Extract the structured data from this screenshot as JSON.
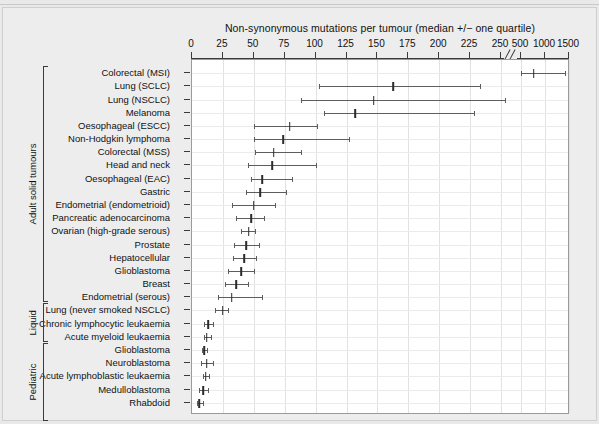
{
  "figure": {
    "background_color": "#ededed",
    "plot_background_color": "#ffffff",
    "axis_color": "#3a3a3a",
    "bar_color": "#5d5d5d",
    "median_color": "#2b2b2b"
  },
  "chart_data": {
    "type": "scatter",
    "title": "Non-synonymous mutations per tumour (median +/− one quartile)",
    "xlabel": "Non-synonymous mutations per tumour (median +/− one quartile)",
    "ylabel": "",
    "orientation": "horizontal",
    "grid": true,
    "legend": null,
    "axis_break": {
      "present": true,
      "between": [
        250,
        500
      ],
      "style": "double-slash"
    },
    "xticks": [
      0,
      25,
      50,
      75,
      100,
      125,
      150,
      175,
      200,
      225,
      250,
      500,
      1000,
      1500
    ],
    "xticklabels": [
      "0",
      "25",
      "50",
      "75",
      "100",
      "125",
      "150",
      "175",
      "200",
      "225",
      "250",
      "500",
      "1000",
      "1500"
    ],
    "xlim": [
      0,
      1500
    ],
    "groups": [
      {
        "name": "Adult solid tumours",
        "start_index": 0,
        "end_index": 17
      },
      {
        "name": "Liquid",
        "start_index": 18,
        "end_index": 20
      },
      {
        "name": "Pediatric",
        "start_index": 21,
        "end_index": 26
      }
    ],
    "categories": [
      "Colorectal (MSI)",
      "Lung (SCLC)",
      "Lung (NSCLC)",
      "Melanoma",
      "Oesophageal (ESCC)",
      "Non-Hodgkin lymphoma",
      "Colorectal (MSS)",
      "Head and neck",
      "Oesophageal (EAC)",
      "Gastric",
      "Endometrial (endometrioid)",
      "Pancreatic adenocarcinoma",
      "Ovarian (high-grade serous)",
      "Prostate",
      "Hepatocellular",
      "Glioblastoma",
      "Breast",
      "Endometrial (serous)",
      "Lung (never smoked NSCLC)",
      "Chronic lymphocytic leukaemia",
      "Acute myeloid leukaemia",
      "Glioblastoma",
      "Neuroblastoma",
      "Acute lymphoblastic leukaemia",
      "Medulloblastoma",
      "Rhabdoid"
    ],
    "points": [
      {
        "label": "Colorectal (MSI)",
        "median": 765,
        "low": 505,
        "high": 1410
      },
      {
        "label": "Lung (SCLC)",
        "median": 163,
        "low": 103,
        "high": 233
      },
      {
        "label": "Lung (NSCLC)",
        "median": 147,
        "low": 88,
        "high": 296
      },
      {
        "label": "Melanoma",
        "median": 132,
        "low": 107,
        "high": 228
      },
      {
        "label": "Oesophageal (ESCC)",
        "median": 79,
        "low": 50,
        "high": 101
      },
      {
        "label": "Non-Hodgkin lymphoma",
        "median": 74,
        "low": 50,
        "high": 127
      },
      {
        "label": "Colorectal (MSS)",
        "median": 66,
        "low": 51,
        "high": 88
      },
      {
        "label": "Head and neck",
        "median": 65,
        "low": 45,
        "high": 100
      },
      {
        "label": "Oesophageal (EAC)",
        "median": 57,
        "low": 48,
        "high": 81
      },
      {
        "label": "Gastric",
        "median": 55,
        "low": 44,
        "high": 76
      },
      {
        "label": "Endometrial (endometrioid)",
        "median": 50,
        "low": 32,
        "high": 67
      },
      {
        "label": "Pancreatic adenocarcinoma",
        "median": 48,
        "low": 36,
        "high": 58
      },
      {
        "label": "Ovarian (high-grade serous)",
        "median": 46,
        "low": 40,
        "high": 51
      },
      {
        "label": "Prostate",
        "median": 44,
        "low": 34,
        "high": 54
      },
      {
        "label": "Hepatocellular",
        "median": 42,
        "low": 33,
        "high": 52
      },
      {
        "label": "Glioblastoma",
        "median": 40,
        "low": 29,
        "high": 50
      },
      {
        "label": "Breast",
        "median": 36,
        "low": 27,
        "high": 45
      },
      {
        "label": "Endometrial (serous)",
        "median": 32,
        "low": 21,
        "high": 57
      },
      {
        "label": "Lung (never smoked NSCLC)",
        "median": 25,
        "low": 19,
        "high": 29
      },
      {
        "label": "Chronic lymphocytic leukaemia",
        "median": 13,
        "low": 10,
        "high": 17
      },
      {
        "label": "Acute myeloid leukaemia",
        "median": 12,
        "low": 10,
        "high": 15
      },
      {
        "label": "Glioblastoma",
        "median": 10,
        "low": 8,
        "high": 12
      },
      {
        "label": "Neuroblastoma",
        "median": 12,
        "low": 7,
        "high": 17
      },
      {
        "label": "Acute lymphoblastic leukaemia",
        "median": 11,
        "low": 9,
        "high": 14
      },
      {
        "label": "Medulloblastoma",
        "median": 9,
        "low": 6,
        "high": 13
      },
      {
        "label": "Rhabdoid",
        "median": 6,
        "low": 4,
        "high": 9
      }
    ]
  }
}
